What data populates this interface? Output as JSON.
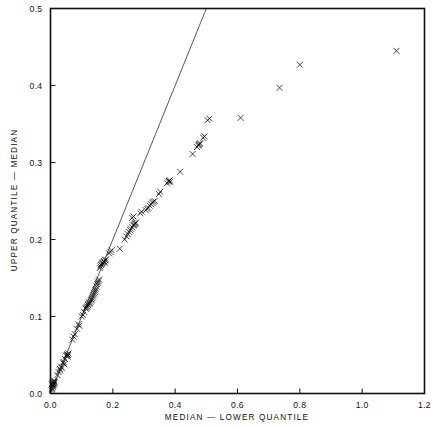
{
  "figure": {
    "kind": "scatter-plot",
    "background_color": "#ffffff",
    "foreground_color": "#111111"
  },
  "chart_data": {
    "type": "scatter",
    "title": "",
    "subtitle": "",
    "xlabel": "MEDIAN  —  LOWER QUANTILE",
    "ylabel": "UPPER QUANTILE  —  MEDIAN",
    "xlim": [
      0.0,
      1.2
    ],
    "ylim": [
      0.0,
      0.5
    ],
    "xticks": [
      0.0,
      0.2,
      0.4,
      0.6,
      0.8,
      1.0,
      1.2
    ],
    "yticks": [
      0.0,
      0.1,
      0.2,
      0.3,
      0.4,
      0.5
    ],
    "xtick_labels": [
      "0.0",
      "0.2",
      "0.4",
      "0.6",
      "0.8",
      "1.0",
      "1.2"
    ],
    "ytick_labels": [
      "0.0",
      "0.1",
      "0.2",
      "0.3",
      "0.4",
      "0.5"
    ],
    "grid": false,
    "legend": null,
    "legend_position": "none",
    "marker": "x",
    "marker_color": "#0d0d0d",
    "marker_size": 3.0,
    "annotations": [],
    "reference_line": {
      "name": "identity-line",
      "label": "y = x",
      "color": "#3a3a3a",
      "x": [
        0.0,
        0.5
      ],
      "y": [
        0.0,
        0.5
      ],
      "style": "solid",
      "width": 0.85
    },
    "series": [
      {
        "name": "quantile-pairs",
        "points": [
          [
            0.004,
            0.004
          ],
          [
            0.005,
            0.006
          ],
          [
            0.006,
            0.007
          ],
          [
            0.007,
            0.009
          ],
          [
            0.008,
            0.01
          ],
          [
            0.009,
            0.011
          ],
          [
            0.01,
            0.012
          ],
          [
            0.011,
            0.013
          ],
          [
            0.012,
            0.014
          ],
          [
            0.013,
            0.015
          ],
          [
            0.004,
            0.012
          ],
          [
            0.006,
            0.013
          ],
          [
            0.008,
            0.014
          ],
          [
            0.01,
            0.016
          ],
          [
            0.012,
            0.017
          ],
          [
            0.022,
            0.024
          ],
          [
            0.026,
            0.028
          ],
          [
            0.03,
            0.032
          ],
          [
            0.031,
            0.03
          ],
          [
            0.034,
            0.035
          ],
          [
            0.036,
            0.033
          ],
          [
            0.04,
            0.04
          ],
          [
            0.042,
            0.041
          ],
          [
            0.044,
            0.038
          ],
          [
            0.046,
            0.045
          ],
          [
            0.05,
            0.049
          ],
          [
            0.052,
            0.05
          ],
          [
            0.054,
            0.051
          ],
          [
            0.056,
            0.05
          ],
          [
            0.058,
            0.052
          ],
          [
            0.055,
            0.048
          ],
          [
            0.07,
            0.07
          ],
          [
            0.074,
            0.074
          ],
          [
            0.078,
            0.077
          ],
          [
            0.085,
            0.084
          ],
          [
            0.09,
            0.09
          ],
          [
            0.092,
            0.088
          ],
          [
            0.1,
            0.1
          ],
          [
            0.104,
            0.102
          ],
          [
            0.108,
            0.106
          ],
          [
            0.112,
            0.111
          ],
          [
            0.114,
            0.11
          ],
          [
            0.116,
            0.112
          ],
          [
            0.118,
            0.113
          ],
          [
            0.12,
            0.115
          ],
          [
            0.122,
            0.116
          ],
          [
            0.124,
            0.118
          ],
          [
            0.126,
            0.117
          ],
          [
            0.128,
            0.119
          ],
          [
            0.13,
            0.121
          ],
          [
            0.132,
            0.122
          ],
          [
            0.134,
            0.124
          ],
          [
            0.136,
            0.126
          ],
          [
            0.138,
            0.128
          ],
          [
            0.14,
            0.13
          ],
          [
            0.142,
            0.132
          ],
          [
            0.144,
            0.134
          ],
          [
            0.146,
            0.136
          ],
          [
            0.148,
            0.139
          ],
          [
            0.15,
            0.142
          ],
          [
            0.152,
            0.144
          ],
          [
            0.154,
            0.146
          ],
          [
            0.156,
            0.148
          ],
          [
            0.158,
            0.163
          ],
          [
            0.16,
            0.165
          ],
          [
            0.162,
            0.167
          ],
          [
            0.164,
            0.168
          ],
          [
            0.166,
            0.169
          ],
          [
            0.168,
            0.17
          ],
          [
            0.17,
            0.171
          ],
          [
            0.172,
            0.172
          ],
          [
            0.174,
            0.17
          ],
          [
            0.176,
            0.173
          ],
          [
            0.178,
            0.174
          ],
          [
            0.188,
            0.182
          ],
          [
            0.192,
            0.184
          ],
          [
            0.196,
            0.186
          ],
          [
            0.222,
            0.188
          ],
          [
            0.238,
            0.2
          ],
          [
            0.244,
            0.204
          ],
          [
            0.248,
            0.207
          ],
          [
            0.252,
            0.21
          ],
          [
            0.256,
            0.212
          ],
          [
            0.258,
            0.214
          ],
          [
            0.262,
            0.216
          ],
          [
            0.266,
            0.218
          ],
          [
            0.268,
            0.219
          ],
          [
            0.27,
            0.22
          ],
          [
            0.272,
            0.221
          ],
          [
            0.274,
            0.222
          ],
          [
            0.262,
            0.228
          ],
          [
            0.266,
            0.23
          ],
          [
            0.288,
            0.234
          ],
          [
            0.292,
            0.236
          ],
          [
            0.306,
            0.238
          ],
          [
            0.31,
            0.24
          ],
          [
            0.314,
            0.241
          ],
          [
            0.318,
            0.244
          ],
          [
            0.322,
            0.246
          ],
          [
            0.326,
            0.248
          ],
          [
            0.33,
            0.249
          ],
          [
            0.334,
            0.25
          ],
          [
            0.348,
            0.259
          ],
          [
            0.352,
            0.262
          ],
          [
            0.374,
            0.273
          ],
          [
            0.378,
            0.275
          ],
          [
            0.38,
            0.276
          ],
          [
            0.382,
            0.277
          ],
          [
            0.384,
            0.275
          ],
          [
            0.416,
            0.288
          ],
          [
            0.456,
            0.311
          ],
          [
            0.47,
            0.32
          ],
          [
            0.474,
            0.322
          ],
          [
            0.476,
            0.323
          ],
          [
            0.478,
            0.324
          ],
          [
            0.48,
            0.325
          ],
          [
            0.49,
            0.332
          ],
          [
            0.494,
            0.334
          ],
          [
            0.504,
            0.355
          ],
          [
            0.51,
            0.357
          ],
          [
            0.61,
            0.358
          ],
          [
            0.735,
            0.397
          ],
          [
            0.8,
            0.427
          ],
          [
            1.11,
            0.445
          ]
        ]
      }
    ]
  }
}
